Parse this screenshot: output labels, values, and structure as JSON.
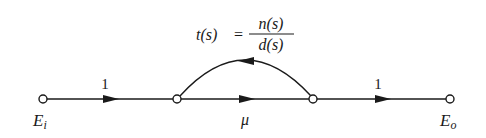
{
  "diagram": {
    "type": "signal-flow-graph",
    "colors": {
      "stroke": "#1a1a1a",
      "background": "#ffffff"
    },
    "nodes": [
      {
        "id": "Ei",
        "label_main": "E",
        "label_sub": "i",
        "x": 43,
        "y": 99
      },
      {
        "id": "n2",
        "label_main": "",
        "label_sub": "",
        "x": 177,
        "y": 99
      },
      {
        "id": "n3",
        "label_main": "",
        "label_sub": "",
        "x": 313,
        "y": 99
      },
      {
        "id": "Eo",
        "label_main": "E",
        "label_sub": "o",
        "x": 450,
        "y": 99
      }
    ],
    "edges": [
      {
        "from": "Ei",
        "to": "n2",
        "gain": "1",
        "direction": "forward"
      },
      {
        "from": "n2",
        "to": "n3",
        "gain": "μ",
        "direction": "forward"
      },
      {
        "from": "n3",
        "to": "Eo",
        "gain": "1",
        "direction": "forward"
      },
      {
        "from": "n3",
        "to": "n2",
        "gain": "t(s)",
        "direction": "feedback-arc"
      }
    ],
    "feedback_formula": {
      "lhs": "t(s)",
      "equals": "=",
      "numerator": "n(s)",
      "denominator": "d(s)"
    },
    "labels": {
      "edge_1_gain": "1",
      "edge_2_gain": "μ",
      "edge_3_gain": "1",
      "input_main": "E",
      "input_sub": "i",
      "output_main": "E",
      "output_sub": "o"
    }
  }
}
